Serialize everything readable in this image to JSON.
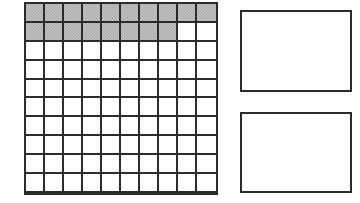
{
  "figure": {
    "background_color": "#fefefe",
    "line_color": "#2b2b2b"
  },
  "grid": {
    "name": "hundreds-grid",
    "columns": 10,
    "rows": 10,
    "total_cells": 100,
    "shaded_count": 18,
    "unshaded_count": 82,
    "shade_color": "#a6a6a6",
    "cell_color": "#fdfdfd",
    "rows_data": [
      [
        1,
        1,
        1,
        1,
        1,
        1,
        1,
        1,
        1,
        1
      ],
      [
        1,
        1,
        1,
        1,
        1,
        1,
        1,
        1,
        0,
        0
      ],
      [
        0,
        0,
        0,
        0,
        0,
        0,
        0,
        0,
        0,
        0
      ],
      [
        0,
        0,
        0,
        0,
        0,
        0,
        0,
        0,
        0,
        0
      ],
      [
        0,
        0,
        0,
        0,
        0,
        0,
        0,
        0,
        0,
        0
      ],
      [
        0,
        0,
        0,
        0,
        0,
        0,
        0,
        0,
        0,
        0
      ],
      [
        0,
        0,
        0,
        0,
        0,
        0,
        0,
        0,
        0,
        0
      ],
      [
        0,
        0,
        0,
        0,
        0,
        0,
        0,
        0,
        0,
        0
      ],
      [
        0,
        0,
        0,
        0,
        0,
        0,
        0,
        0,
        0,
        0
      ],
      [
        0,
        0,
        0,
        0,
        0,
        0,
        0,
        0,
        0,
        0
      ]
    ]
  },
  "answer_boxes": [
    {
      "name": "answer-box-top",
      "value": ""
    },
    {
      "name": "answer-box-bottom",
      "value": ""
    }
  ]
}
